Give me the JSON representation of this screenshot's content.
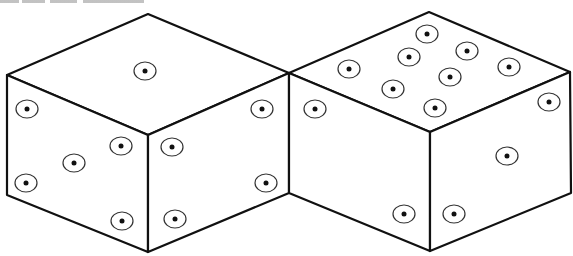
{
  "figure": {
    "type": "isometric-dice-diagram",
    "colors": {
      "stroke": "#111111",
      "pip_ring": "#333333",
      "background": "#ffffff"
    },
    "dice": [
      {
        "name": "left-die",
        "faces": {
          "top": {
            "pips": 1,
            "points": "148,14 289,73 148,135 7,75",
            "pip_positions": [
              [
                145,
                71
              ]
            ]
          },
          "left": {
            "pips": 5,
            "points": "7,75 148,135 148,252 7,195",
            "pip_positions": [
              [
                27,
                109
              ],
              [
                121,
                146
              ],
              [
                74,
                163
              ],
              [
                26,
                183
              ],
              [
                122,
                221
              ]
            ]
          },
          "right": {
            "pips": 4,
            "points": "148,135 289,73 289,193 148,252",
            "pip_positions": [
              [
                262,
                109
              ],
              [
                172,
                147
              ],
              [
                266,
                183
              ],
              [
                175,
                219
              ]
            ]
          }
        }
      },
      {
        "name": "right-die",
        "faces": {
          "top": {
            "pips": 8,
            "points": "429,12 570,72 430,132 289,73",
            "pip_positions": [
              [
                427,
                34
              ],
              [
                467,
                51
              ],
              [
                409,
                57
              ],
              [
                349,
                69
              ],
              [
                509,
                67
              ],
              [
                450,
                77
              ],
              [
                393,
                89
              ],
              [
                435,
                108
              ]
            ]
          },
          "left": {
            "pips": 2,
            "points": "289,73 430,132 430,251 289,193",
            "pip_positions": [
              [
                315,
                109
              ],
              [
                404,
                214
              ]
            ]
          },
          "right": {
            "pips": 3,
            "points": "430,132 570,72 571,193 430,251",
            "pip_positions": [
              [
                549,
                102
              ],
              [
                507,
                156
              ],
              [
                454,
                214
              ]
            ]
          }
        }
      }
    ]
  }
}
